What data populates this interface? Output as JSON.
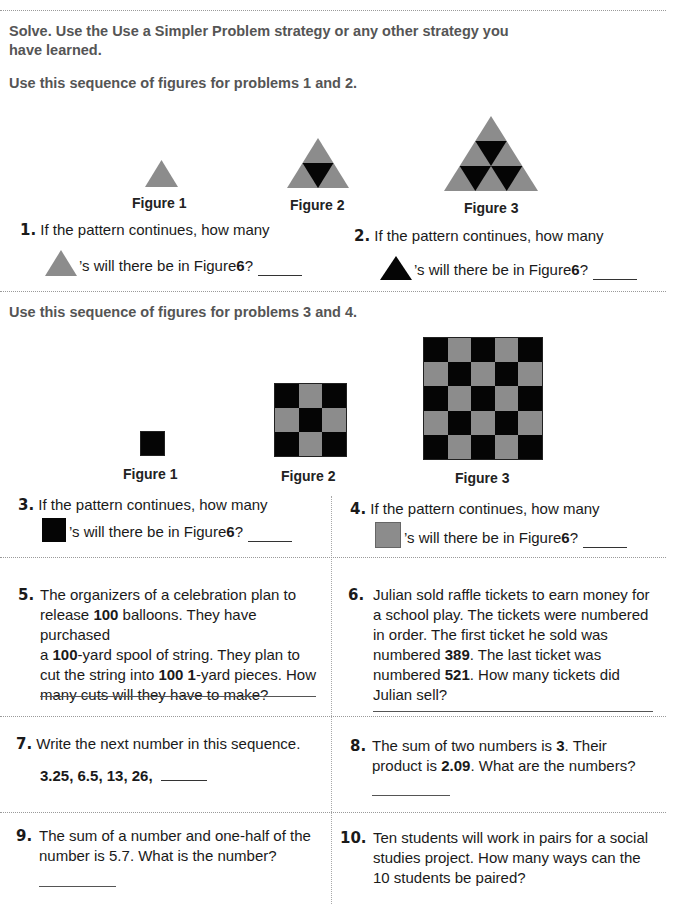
{
  "instructions": {
    "line1": "Solve. Use the Use a Simpler Problem strategy or any other strategy you",
    "line2": "have learned."
  },
  "colors": {
    "gray": "#8c8c8c",
    "black": "#050505",
    "divider": "#9a9a9a"
  },
  "section1": {
    "intro": "Use this sequence of figures for problems 1 and 2.",
    "figures": [
      {
        "caption": "Figure 1",
        "shape": "triangle",
        "rows": 1
      },
      {
        "caption": "Figure 2",
        "shape": "triangle",
        "rows": 2
      },
      {
        "caption": "Figure 3",
        "shape": "triangle",
        "rows": 3
      }
    ]
  },
  "section2": {
    "intro": "Use this sequence of figures for problems 3 and 4.",
    "figures": [
      {
        "caption": "Figure 1",
        "shape": "checkerboard",
        "size": 1
      },
      {
        "caption": "Figure 2",
        "shape": "checkerboard",
        "size": 3
      },
      {
        "caption": "Figure 3",
        "shape": "checkerboard",
        "size": 5
      }
    ]
  },
  "problems": [
    {
      "num": "1.",
      "line1": "If the pattern continues, how many",
      "icon": "gray-triangle-icon",
      "line2_pre": "’s will there be in Figure ",
      "bold": "6",
      "line2_post": "?"
    },
    {
      "num": "2.",
      "line1": "If the pattern continues, how many",
      "icon": "black-triangle-icon",
      "line2_pre": "’s will there be in Figure ",
      "bold": "6",
      "line2_post": "?"
    },
    {
      "num": "3.",
      "line1": "If the pattern continues, how many",
      "icon": "black-square-icon",
      "line2_pre": "’s will there be in Figure ",
      "bold": "6",
      "line2_post": "?"
    },
    {
      "num": "4.",
      "line1": "If the pattern continues, how many",
      "icon": "gray-square-icon",
      "line2_pre": "’s will there be in Figure ",
      "bold": "6",
      "line2_post": "?"
    },
    {
      "num": "5.",
      "lines": [
        [
          "The organizers of a celebration plan to"
        ],
        [
          "release ",
          {
            "b": "100"
          },
          " balloons. They have purchased"
        ],
        [
          "a ",
          {
            "b": "100"
          },
          "-yard spool of string. They plan to"
        ],
        [
          "cut the string into ",
          {
            "b": "100 1"
          },
          "-yard pieces. How"
        ],
        [
          "many cuts will they have to make?"
        ]
      ]
    },
    {
      "num": "6.",
      "lines": [
        [
          "Julian sold raffle tickets to earn money for"
        ],
        [
          "a school play. The tickets were numbered"
        ],
        [
          "in order. The first ticket he sold was"
        ],
        [
          "numbered ",
          {
            "b": "389"
          },
          ". The last ticket was"
        ],
        [
          "numbered ",
          {
            "b": "521"
          },
          ". How many tickets did"
        ],
        [
          "Julian sell?"
        ]
      ]
    },
    {
      "num": "7.",
      "text": "Write the next number in this sequence.",
      "sequence": "3.25, 6.5, 13, 26,"
    },
    {
      "num": "8.",
      "lines": [
        [
          "The sum of two numbers is ",
          {
            "b": "3"
          },
          ". Their"
        ],
        [
          "product is ",
          {
            "b": "2.09"
          },
          ". What are the numbers?"
        ]
      ]
    },
    {
      "num": "9.",
      "lines": [
        [
          "The sum of a number and one-half of the"
        ],
        [
          "number is 5.7. What is the number?"
        ]
      ]
    },
    {
      "num": "10.",
      "lines": [
        [
          "Ten students will work in pairs for a social"
        ],
        [
          "studies project. How many ways can the"
        ],
        [
          "10 students be paired?"
        ]
      ]
    }
  ]
}
